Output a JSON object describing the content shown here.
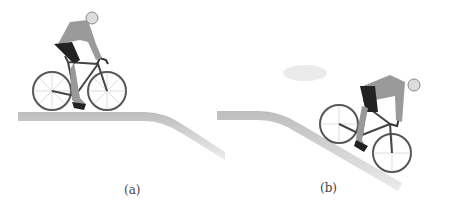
{
  "figure": {
    "panels": [
      {
        "label": "(a)",
        "description": "Cyclist riding on flat ground before a downhill slope"
      },
      {
        "label": "(b)",
        "description": "Cyclist riding down the slope"
      }
    ],
    "colors": {
      "road": "#c8c8c8",
      "frame": "#555555",
      "jersey": "#9a9a9a",
      "shorts": "#222222"
    }
  }
}
